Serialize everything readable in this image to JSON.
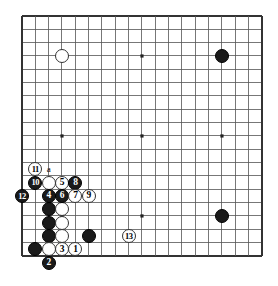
{
  "board": {
    "title": "Go board diagram",
    "size": 19,
    "grid_origin_x": 22,
    "grid_origin_y": 16,
    "grid_spacing": 13.33,
    "line_color": "#555555",
    "edge_color": "#333333",
    "background_color": "#ffffff",
    "black_color": "#1a1a1a",
    "white_color": "#ffffff",
    "stone_diameter": 14,
    "star_points": [
      {
        "col": 3,
        "row": 3
      },
      {
        "col": 9,
        "row": 3
      },
      {
        "col": 15,
        "row": 3
      },
      {
        "col": 3,
        "row": 9
      },
      {
        "col": 9,
        "row": 9
      },
      {
        "col": 15,
        "row": 9
      },
      {
        "col": 3,
        "row": 15
      },
      {
        "col": 9,
        "row": 15
      },
      {
        "col": 15,
        "row": 15
      }
    ]
  },
  "stones": [
    {
      "name": "white-stone-upper-left",
      "color": "white",
      "label": "",
      "col": 3,
      "row": 3
    },
    {
      "name": "black-stone-upper-right",
      "color": "black",
      "label": "",
      "col": 15,
      "row": 3
    },
    {
      "name": "black-stone-lower-right",
      "color": "black",
      "label": "",
      "col": 15,
      "row": 15
    },
    {
      "name": "white-move-11",
      "color": "white",
      "label": "11",
      "col": 1,
      "row": 11.5
    },
    {
      "name": "black-move-10",
      "color": "black",
      "label": "10",
      "col": 1,
      "row": 12.5
    },
    {
      "name": "white-stone-b2-12",
      "color": "white",
      "label": "",
      "col": 2,
      "row": 12.5
    },
    {
      "name": "white-move-5",
      "color": "white",
      "label": "5",
      "col": 3,
      "row": 12.5
    },
    {
      "name": "black-move-8",
      "color": "black",
      "label": "8",
      "col": 4,
      "row": 12.5
    },
    {
      "name": "black-move-12",
      "color": "black",
      "label": "12",
      "col": 0,
      "row": 13.5
    },
    {
      "name": "black-move-4",
      "color": "black",
      "label": "4",
      "col": 2,
      "row": 13.5
    },
    {
      "name": "black-move-6",
      "color": "black",
      "label": "6",
      "col": 3,
      "row": 13.5
    },
    {
      "name": "white-move-7",
      "color": "white",
      "label": "7",
      "col": 4,
      "row": 13.5
    },
    {
      "name": "white-move-9",
      "color": "white",
      "label": "9",
      "col": 5,
      "row": 13.5
    },
    {
      "name": "black-stone-c5",
      "color": "black",
      "label": "",
      "col": 2,
      "row": 14.5
    },
    {
      "name": "white-stone-d5",
      "color": "white",
      "label": "",
      "col": 3,
      "row": 14.5
    },
    {
      "name": "black-stone-c4",
      "color": "black",
      "label": "",
      "col": 2,
      "row": 15.5
    },
    {
      "name": "white-stone-d4",
      "color": "white",
      "label": "",
      "col": 3,
      "row": 15.5
    },
    {
      "name": "black-stone-c3",
      "color": "black",
      "label": "",
      "col": 2,
      "row": 16.5
    },
    {
      "name": "white-stone-d3",
      "color": "white",
      "label": "",
      "col": 3,
      "row": 16.5
    },
    {
      "name": "black-stone-g3",
      "color": "black",
      "label": "",
      "col": 5,
      "row": 16.5
    },
    {
      "name": "black-stone-b2",
      "color": "black",
      "label": "",
      "col": 1,
      "row": 17.5
    },
    {
      "name": "white-stone-c2",
      "color": "white",
      "label": "",
      "col": 2,
      "row": 17.5
    },
    {
      "name": "white-move-3",
      "color": "white",
      "label": "3",
      "col": 3,
      "row": 17.5
    },
    {
      "name": "white-move-1",
      "color": "white",
      "label": "1",
      "col": 4,
      "row": 17.5
    },
    {
      "name": "black-move-2",
      "color": "black",
      "label": "2",
      "col": 2,
      "row": 18.5
    },
    {
      "name": "white-move-13",
      "color": "white",
      "label": "13",
      "col": 8,
      "row": 16.5
    }
  ],
  "markers": [
    {
      "name": "point-label-a",
      "label": "a",
      "col": 2,
      "row": 11.5
    }
  ]
}
